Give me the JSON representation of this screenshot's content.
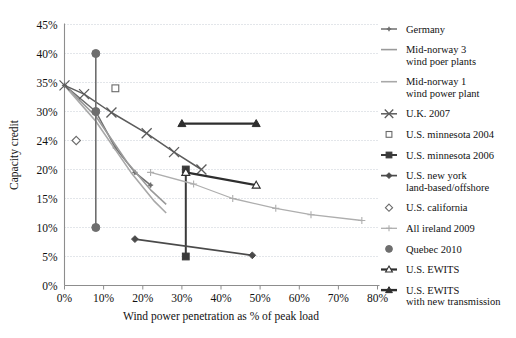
{
  "chart_data": {
    "type": "line",
    "title": "",
    "xlabel": "Wind power penetration as % of peak load",
    "ylabel": "Capacity credit",
    "xlim": [
      0,
      80
    ],
    "ylim": [
      0,
      45
    ],
    "grid": true,
    "legend_position": "right",
    "x_tick_labels": [
      "0%",
      "10%",
      "20%",
      "30%",
      "40%",
      "50%",
      "60%",
      "70%",
      "80%"
    ],
    "x_tick_values": [
      0,
      10,
      20,
      30,
      40,
      50,
      60,
      70,
      80
    ],
    "y_tick_labels": [
      "0%",
      "5%",
      "10%",
      "15%",
      "20%",
      "24%",
      "30%",
      "35%",
      "40%",
      "45%"
    ],
    "y_tick_values": [
      0,
      5,
      10,
      15,
      20,
      24,
      30,
      35,
      40,
      45
    ],
    "series": [
      {
        "name": "Germany",
        "color": "#6e6e6e",
        "marker": "plus-dot",
        "points": [
          [
            0,
            34.5
          ],
          [
            8,
            30.0
          ],
          [
            13,
            23.0
          ],
          [
            18,
            19.5
          ],
          [
            22,
            17.3
          ]
        ]
      },
      {
        "name": "Mid-norway 3 wind poer plants",
        "color": "#9a9a9a",
        "marker": "none",
        "points": [
          [
            0,
            34.5
          ],
          [
            8,
            29.0
          ],
          [
            16,
            21.0
          ],
          [
            22,
            16.5
          ],
          [
            26,
            14.0
          ]
        ]
      },
      {
        "name": "Mid-norway 1 wind power plant",
        "color": "#a8a8a8",
        "marker": "none",
        "points": [
          [
            0,
            34.5
          ],
          [
            8,
            28.0
          ],
          [
            17,
            19.5
          ],
          [
            23,
            14.5
          ],
          [
            26,
            12.5
          ]
        ]
      },
      {
        "name": "U.K. 2007",
        "color": "#5c5c5c",
        "marker": "x",
        "points": [
          [
            0,
            34.5
          ],
          [
            5,
            33.0
          ],
          [
            12,
            29.8
          ],
          [
            21,
            25.5
          ],
          [
            28,
            22.4
          ],
          [
            35,
            20.0
          ]
        ]
      },
      {
        "name": "U.S. minnesota 2004",
        "color": "#6a6a6a",
        "marker": "open-square",
        "points": [
          [
            13,
            34.0
          ]
        ]
      },
      {
        "name": "U.S. minnesota 2006",
        "color": "#3a3a3a",
        "marker": "filled-square",
        "points": [
          [
            31,
            20.0
          ],
          [
            31,
            5.0
          ]
        ]
      },
      {
        "name": "U.S. new york land-based/offshore",
        "color": "#4a4a4a",
        "marker": "filled-diamond",
        "points": [
          [
            18,
            8.0
          ],
          [
            48,
            5.2
          ]
        ]
      },
      {
        "name": "U.S. california",
        "color": "#6a6a6a",
        "marker": "open-diamond",
        "points": [
          [
            3,
            24.0
          ]
        ]
      },
      {
        "name": "All ireland 2009",
        "color": "#aeaeae",
        "marker": "plus",
        "points": [
          [
            22,
            19.5
          ],
          [
            33,
            17.5
          ],
          [
            43,
            15.0
          ],
          [
            54,
            13.3
          ],
          [
            63,
            12.2
          ],
          [
            76,
            11.2
          ]
        ]
      },
      {
        "name": "Quebec 2010",
        "color": "#6e6e6e",
        "marker": "filled-circle",
        "points": [
          [
            8,
            40.0
          ],
          [
            8,
            30.0
          ],
          [
            8,
            10.0
          ]
        ]
      },
      {
        "name": "U.S. EWITS",
        "color": "#2e2e2e",
        "marker": "open-triangle",
        "points": [
          [
            31,
            19.5
          ],
          [
            49,
            17.3
          ]
        ]
      },
      {
        "name": "U.S. EWITS with new transmission",
        "color": "#2e2e2e",
        "marker": "filled-triangle",
        "points": [
          [
            30,
            27.5
          ],
          [
            49,
            27.5
          ]
        ]
      }
    ]
  },
  "legend": {
    "entries": [
      {
        "label_lines": [
          "Germany"
        ],
        "key": "germany"
      },
      {
        "label_lines": [
          "Mid-norway 3",
          "wind poer plants"
        ],
        "key": "mid-norway-3"
      },
      {
        "label_lines": [
          "Mid-norway 1",
          "wind power plant"
        ],
        "key": "mid-norway-1"
      },
      {
        "label_lines": [
          "U.K. 2007"
        ],
        "key": "uk-2007"
      },
      {
        "label_lines": [
          "U.S. minnesota 2004"
        ],
        "key": "us-minnesota-2004"
      },
      {
        "label_lines": [
          "U.S. minnesota 2006"
        ],
        "key": "us-minnesota-2006"
      },
      {
        "label_lines": [
          "U.S. new york",
          "land-based/offshore"
        ],
        "key": "us-new-york"
      },
      {
        "label_lines": [
          "U.S. california"
        ],
        "key": "us-california"
      },
      {
        "label_lines": [
          "All ireland 2009"
        ],
        "key": "all-ireland-2009"
      },
      {
        "label_lines": [
          "Quebec 2010"
        ],
        "key": "quebec-2010"
      },
      {
        "label_lines": [
          "U.S. EWITS"
        ],
        "key": "us-ewits"
      },
      {
        "label_lines": [
          "U.S. EWITS",
          "with new transmission"
        ],
        "key": "us-ewits-new-transmission"
      }
    ]
  },
  "colors": {
    "grid": "#b9bfc9",
    "axis": "#8d8d8d",
    "text": "#111111",
    "background": "#ffffff"
  }
}
